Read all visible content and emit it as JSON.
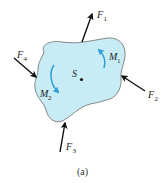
{
  "figure": {
    "caption": "(a)",
    "body_point_label": "S",
    "colors": {
      "body_fill": "#c8ecf6",
      "body_stroke": "#6a6a6a",
      "force_arrow": "#111111",
      "moment_arrow": "#2a9fd6",
      "text": "#222222"
    },
    "forces": [
      {
        "name": "F",
        "subscript": "1"
      },
      {
        "name": "F",
        "subscript": "2"
      },
      {
        "name": "F",
        "subscript": "3"
      },
      {
        "name": "F",
        "subscript": "4"
      }
    ],
    "moments": [
      {
        "name": "M",
        "subscript": "1"
      },
      {
        "name": "M",
        "subscript": "2"
      }
    ]
  }
}
